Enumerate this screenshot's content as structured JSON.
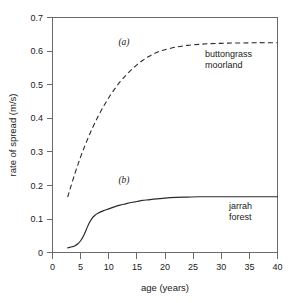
{
  "chart_data": {
    "type": "line",
    "title": "",
    "xlabel": "age (years)",
    "ylabel": "rate of spread (m/s)",
    "xlim": [
      0,
      40
    ],
    "ylim": [
      0,
      0.7
    ],
    "grid": false,
    "legend_position": "inline-annotation",
    "xticks": [
      "0",
      "5",
      "10",
      "15",
      "20",
      "25",
      "30",
      "35",
      "40"
    ],
    "xtick_values": [
      0,
      5,
      10,
      15,
      20,
      25,
      30,
      35,
      40
    ],
    "yticks": [
      "0",
      "0.1",
      "0.2",
      "0.3",
      "0.4",
      "0.5",
      "0.6",
      "0.7"
    ],
    "ytick_values": [
      0,
      0.1,
      0.2,
      0.3,
      0.4,
      0.5,
      0.6,
      0.7
    ],
    "series": [
      {
        "name": "buttongrass moorland",
        "tag": "(a)",
        "style": "dashed",
        "color": "#2b2b2b",
        "x": [
          2.7,
          3,
          4,
          5,
          6,
          7,
          8,
          9,
          10,
          11,
          12,
          13,
          14,
          15,
          16,
          17,
          18,
          19,
          20,
          22,
          24,
          26,
          28,
          30,
          32,
          34,
          36,
          38,
          40
        ],
        "values": [
          0.165,
          0.182,
          0.236,
          0.285,
          0.328,
          0.367,
          0.402,
          0.433,
          0.461,
          0.486,
          0.508,
          0.527,
          0.544,
          0.559,
          0.572,
          0.583,
          0.592,
          0.599,
          0.604,
          0.612,
          0.617,
          0.62,
          0.622,
          0.623,
          0.624,
          0.624,
          0.625,
          0.625,
          0.625
        ]
      },
      {
        "name": "jarrah forest",
        "tag": "(b)",
        "style": "solid",
        "color": "#2b2b2b",
        "x": [
          2.7,
          3,
          3.5,
          4,
          4.5,
          5,
          5.5,
          6,
          6.5,
          7,
          7.5,
          8,
          9,
          10,
          11,
          12,
          13,
          14,
          15,
          16,
          17,
          18,
          20,
          22,
          24,
          26,
          28,
          30,
          33,
          36,
          40
        ],
        "values": [
          0.014,
          0.015,
          0.017,
          0.02,
          0.026,
          0.035,
          0.049,
          0.068,
          0.087,
          0.101,
          0.11,
          0.116,
          0.124,
          0.13,
          0.136,
          0.141,
          0.145,
          0.149,
          0.152,
          0.155,
          0.157,
          0.159,
          0.162,
          0.164,
          0.165,
          0.166,
          0.166,
          0.166,
          0.166,
          0.166,
          0.166
        ]
      }
    ],
    "annotations": [
      {
        "text": "(a)",
        "x": 13.2,
        "y": 0.645,
        "role": "curve-tag-a"
      },
      {
        "text": "(b)",
        "x": 13.2,
        "y": 0.205,
        "role": "curve-tag-b"
      },
      {
        "text": "buttongrass",
        "x": 30.5,
        "y": 0.585,
        "role": "series-label-a-line1"
      },
      {
        "text": "moorland",
        "x": 30.5,
        "y": 0.545,
        "role": "series-label-a-line2"
      },
      {
        "text": "jarrah",
        "x": 32.5,
        "y": 0.128,
        "role": "series-label-b-line1"
      },
      {
        "text": "forest",
        "x": 32.5,
        "y": 0.088,
        "role": "series-label-b-line2"
      }
    ]
  },
  "axes": {
    "x_title": "age (years)",
    "y_title": "rate of spread (m/s)"
  },
  "x_tick_labels": {
    "t0": "0",
    "t1": "5",
    "t2": "10",
    "t3": "15",
    "t4": "20",
    "t5": "25",
    "t6": "30",
    "t7": "35",
    "t8": "40"
  },
  "y_tick_labels": {
    "t0": "0",
    "t1": "0.1",
    "t2": "0.2",
    "t3": "0.3",
    "t4": "0.4",
    "t5": "0.5",
    "t6": "0.6",
    "t7": "0.7"
  },
  "labels": {
    "tag_a": "(a)",
    "tag_b": "(b)",
    "series_a_line1": "buttongrass",
    "series_a_line2": "moorland",
    "series_b_line1": "jarrah",
    "series_b_line2": "forest"
  },
  "colors": {
    "ink": "#2b2b2b",
    "axis": "#555555",
    "background": "#ffffff"
  }
}
